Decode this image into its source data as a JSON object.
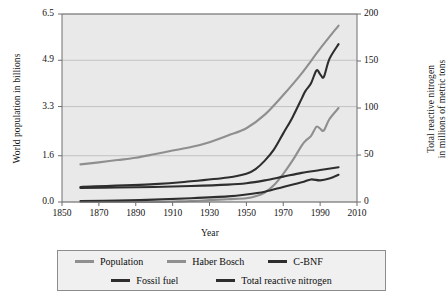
{
  "chart_data": {
    "type": "line",
    "title": "",
    "xlabel": "Year",
    "ylabel": "World population in billions",
    "ylabel_right": "Total reactive nitrogen\nin millions of metric tons",
    "xlim": [
      1850,
      2010
    ],
    "ylim": [
      0.0,
      6.5
    ],
    "ylim_right": [
      0,
      200
    ],
    "xticks": [
      1850,
      1870,
      1890,
      1910,
      1930,
      1950,
      1970,
      1990,
      2010
    ],
    "yticks_left": [
      "0.0",
      "1.6",
      "3.3",
      "4.9",
      "6.5"
    ],
    "yticks_right": [
      "0",
      "50",
      "100",
      "150",
      "200"
    ],
    "grid": true,
    "legend_position": "below-outside",
    "series": [
      {
        "name": "Population",
        "axis": "left",
        "color": "#8f8f8f",
        "x": [
          1860,
          1870,
          1880,
          1890,
          1900,
          1910,
          1920,
          1930,
          1940,
          1950,
          1960,
          1970,
          1980,
          1990,
          2000
        ],
        "values": [
          1.3,
          1.37,
          1.45,
          1.53,
          1.65,
          1.78,
          1.9,
          2.07,
          2.3,
          2.55,
          3.02,
          3.7,
          4.45,
          5.3,
          6.1
        ]
      },
      {
        "name": "Haber Bosch",
        "axis": "right",
        "color": "#8f8f8f",
        "x": [
          1860,
          1900,
          1910,
          1920,
          1930,
          1940,
          1950,
          1955,
          1960,
          1965,
          1970,
          1975,
          1980,
          1982,
          1985,
          1988,
          1990,
          1992,
          1995,
          2000
        ],
        "values": [
          0,
          0,
          0.5,
          1,
          2,
          3,
          4,
          6,
          10,
          18,
          30,
          44,
          60,
          65,
          70,
          80,
          78,
          76,
          88,
          100
        ]
      },
      {
        "name": "C-BNF",
        "axis": "right",
        "color": "#2e2e2e",
        "x": [
          1860,
          1880,
          1900,
          1920,
          1940,
          1950,
          1960,
          1970,
          1980,
          1990,
          2000
        ],
        "values": [
          15,
          15.5,
          16,
          17,
          18.5,
          20,
          23,
          27,
          31,
          34,
          37
        ]
      },
      {
        "name": "Fossil fuel",
        "axis": "right",
        "color": "#2e2e2e",
        "x": [
          1860,
          1880,
          1900,
          1920,
          1940,
          1950,
          1960,
          1970,
          1980,
          1985,
          1990,
          1995,
          2000
        ],
        "values": [
          1,
          1.5,
          2.5,
          4,
          6,
          8,
          11,
          16,
          21,
          24,
          23,
          25,
          29
        ]
      },
      {
        "name": "Total reactive nitrogen",
        "axis": "right",
        "color": "#2e2e2e",
        "x": [
          1860,
          1900,
          1920,
          1940,
          1950,
          1955,
          1960,
          1965,
          1970,
          1975,
          1980,
          1982,
          1985,
          1988,
          1990,
          1992,
          1995,
          2000
        ],
        "values": [
          16,
          19,
          22,
          26,
          30,
          35,
          44,
          56,
          73,
          90,
          110,
          118,
          126,
          140,
          136,
          133,
          152,
          168
        ]
      }
    ]
  },
  "legend": {
    "rows": [
      [
        {
          "label": "Population",
          "color": "#8f8f8f"
        },
        {
          "label": "Haber Bosch",
          "color": "#8f8f8f"
        },
        {
          "label": "C-BNF",
          "color": "#2e2e2e"
        }
      ],
      [
        {
          "label": "Fossil fuel",
          "color": "#2e2e2e"
        },
        {
          "label": "Total reactive nitrogen",
          "color": "#2e2e2e"
        }
      ]
    ]
  },
  "style": {
    "plot_background": "#e9e9e9",
    "grid_color": "#b9b9b9",
    "axis_color": "#6e6e6e",
    "legend_background": "#f0f0f0",
    "legend_border": "#8c8c8c"
  }
}
